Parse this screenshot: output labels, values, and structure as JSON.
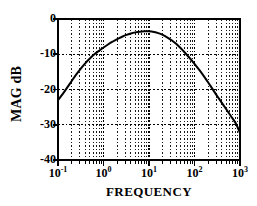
{
  "figure": {
    "background_color": "#ffffff",
    "ink_color": "#000000",
    "grid_color": "#000000",
    "plot_frame": {
      "left": 58,
      "top": 19,
      "right": 240,
      "bottom": 160
    }
  },
  "axes": {
    "ylabel": "MAG dB",
    "xlabel": "FREQUENCY",
    "y_ticks": [
      {
        "value": 0,
        "label": "0"
      },
      {
        "value": -10,
        "label": "-10"
      },
      {
        "value": -20,
        "label": "-20"
      },
      {
        "value": -30,
        "label": "-30"
      },
      {
        "value": -40,
        "label": "-40"
      }
    ],
    "x_ticks": [
      {
        "value": 0.1,
        "mantissa": "10",
        "exponent": "-1"
      },
      {
        "value": 1,
        "mantissa": "10",
        "exponent": "0"
      },
      {
        "value": 10,
        "mantissa": "10",
        "exponent": "1"
      },
      {
        "value": 100,
        "mantissa": "10",
        "exponent": "2"
      },
      {
        "value": 1000,
        "mantissa": "10",
        "exponent": "3"
      }
    ]
  },
  "chart_data": {
    "type": "line",
    "title": "",
    "subtitle": "",
    "xlabel": "FREQUENCY",
    "ylabel": "MAG dB",
    "xscale": "log",
    "yscale": "linear",
    "xlim": [
      0.1,
      1000
    ],
    "ylim": [
      -40,
      0
    ],
    "grid": true,
    "grid_style": "dotted",
    "grid_minor_x": true,
    "grid_major_y_values": [
      -10,
      -20,
      -30
    ],
    "legend": null,
    "legend_position": "none",
    "annotations": [],
    "series": [
      {
        "name": "magnitude response",
        "color": "#000000",
        "linewidth": 2,
        "x": [
          0.1,
          0.13,
          0.16,
          0.2,
          0.25,
          0.32,
          0.4,
          0.5,
          0.63,
          0.8,
          1.0,
          1.3,
          1.6,
          2.0,
          2.5,
          3.2,
          4.0,
          5.0,
          6.3,
          8.0,
          10.0,
          13.0,
          16.0,
          20.0,
          25.0,
          32.0,
          40.0,
          50.0,
          63.0,
          80.0,
          100.0,
          130.0,
          160.0,
          200.0,
          250.0,
          320.0,
          400.0,
          500.0,
          630.0,
          800.0,
          1000.0
        ],
        "y": [
          -23.0,
          -21.1,
          -19.4,
          -17.6,
          -15.8,
          -14.0,
          -12.5,
          -11.2,
          -10.0,
          -9.0,
          -8.1,
          -7.1,
          -6.4,
          -5.7,
          -5.1,
          -4.5,
          -4.1,
          -3.8,
          -3.6,
          -3.5,
          -3.5,
          -3.7,
          -4.0,
          -4.5,
          -5.2,
          -6.1,
          -7.1,
          -8.3,
          -9.7,
          -11.2,
          -12.7,
          -14.6,
          -16.2,
          -18.0,
          -19.9,
          -22.0,
          -23.8,
          -25.6,
          -27.5,
          -29.5,
          -32.3
        ]
      }
    ],
    "peak": {
      "x": 8.0,
      "y": -3.5
    },
    "start_point": {
      "x": 0.1,
      "y": -23.0
    },
    "end_point": {
      "x": 1000.0,
      "y": -32.3
    }
  }
}
